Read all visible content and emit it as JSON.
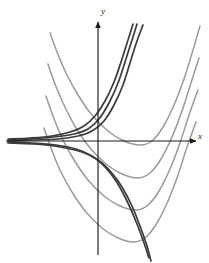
{
  "figure": {
    "type": "math-curve-family-diagram",
    "background_color": "#ffffff",
    "axes": {
      "x_label": "x",
      "y_label": "y",
      "axis_color": "#1b1b1b",
      "origin_px": [
        98,
        141
      ],
      "x_axis_y_px": 141,
      "y_axis_x_px": 98,
      "x_axis_from_px": [
        6,
        141
      ],
      "x_axis_to_px": [
        196,
        141
      ],
      "y_axis_from_px": [
        98,
        255
      ],
      "y_axis_to_px": [
        98,
        22
      ],
      "arrowheads": [
        "x-positive",
        "y-positive"
      ]
    },
    "chart_data": {
      "type": "line",
      "title": "",
      "xlabel": "x",
      "ylabel": "y",
      "grid": false,
      "legend": null,
      "xlim": [
        -3.5,
        3.5
      ],
      "ylim": [
        -4.0,
        4.5
      ],
      "annotations": [
        "Dark curves converge to a horizontal asymptote on the left, forming a thick band near y = 0 left of the y-axis.",
        "Gray curves are a nested family of upward-opening parabola-like curves whose vertices descend to the lower-left."
      ],
      "series": [
        {
          "name": "gray-parabola-1",
          "color": "#9a9a9a",
          "style": "solid",
          "role": "solution-curve",
          "points_px": [
            [
              50,
              33
            ],
            [
              57,
              52
            ],
            [
              66,
              73
            ],
            [
              78,
              95
            ],
            [
              92,
              115
            ],
            [
              108,
              131
            ],
            [
              124,
              141
            ],
            [
              140,
              145
            ],
            [
              152,
              141
            ],
            [
              163,
              127
            ],
            [
              174,
              105
            ],
            [
              184,
              79
            ],
            [
              193,
              50
            ],
            [
              200,
              26
            ]
          ]
        },
        {
          "name": "gray-parabola-2",
          "color": "#9a9a9a",
          "style": "solid",
          "role": "solution-curve",
          "points_px": [
            [
              48,
              64
            ],
            [
              55,
              84
            ],
            [
              64,
              105
            ],
            [
              76,
              128
            ],
            [
              90,
              148
            ],
            [
              106,
              164
            ],
            [
              122,
              174
            ],
            [
              138,
              178
            ],
            [
              150,
              173
            ],
            [
              161,
              159
            ],
            [
              172,
              137
            ],
            [
              182,
              111
            ],
            [
              191,
              83
            ],
            [
              199,
              58
            ]
          ]
        },
        {
          "name": "gray-parabola-3",
          "color": "#9a9a9a",
          "style": "solid",
          "role": "solution-curve",
          "points_px": [
            [
              46,
              96
            ],
            [
              53,
              116
            ],
            [
              62,
              138
            ],
            [
              74,
              160
            ],
            [
              88,
              180
            ],
            [
              104,
              196
            ],
            [
              120,
              206
            ],
            [
              136,
              210
            ],
            [
              148,
              205
            ],
            [
              159,
              191
            ],
            [
              170,
              169
            ],
            [
              180,
              143
            ],
            [
              189,
              115
            ],
            [
              198,
              90
            ]
          ]
        },
        {
          "name": "gray-parabola-4",
          "color": "#9a9a9a",
          "style": "solid",
          "role": "solution-curve",
          "points_px": [
            [
              44,
              128
            ],
            [
              51,
              148
            ],
            [
              60,
              170
            ],
            [
              72,
              192
            ],
            [
              86,
              212
            ],
            [
              102,
              228
            ],
            [
              118,
              238
            ],
            [
              134,
              242
            ],
            [
              146,
              237
            ],
            [
              157,
              223
            ],
            [
              168,
              201
            ],
            [
              178,
              175
            ],
            [
              187,
              147
            ],
            [
              196,
              122
            ]
          ]
        },
        {
          "name": "dark-exponential-1",
          "color": "#3b3b3b",
          "style": "solid",
          "role": "asymptotic-curve",
          "points_px": [
            [
              8,
              139
            ],
            [
              30,
              138
            ],
            [
              52,
              136
            ],
            [
              70,
              132
            ],
            [
              84,
              126
            ],
            [
              95,
              116
            ],
            [
              105,
              101
            ],
            [
              114,
              82
            ],
            [
              121,
              62
            ],
            [
              128,
              40
            ],
            [
              133,
              24
            ]
          ]
        },
        {
          "name": "dark-exponential-2",
          "color": "#3b3b3b",
          "style": "solid",
          "role": "asymptotic-curve",
          "points_px": [
            [
              8,
              140
            ],
            [
              30,
              139
            ],
            [
              54,
              137
            ],
            [
              74,
              134
            ],
            [
              88,
              129
            ],
            [
              99,
              119
            ],
            [
              109,
              103
            ],
            [
              118,
              83
            ],
            [
              125,
              62
            ],
            [
              132,
              40
            ],
            [
              137,
              24
            ]
          ]
        },
        {
          "name": "dark-exponential-3",
          "color": "#3b3b3b",
          "style": "solid",
          "role": "asymptotic-curve",
          "points_px": [
            [
              8,
              141
            ],
            [
              32,
              140
            ],
            [
              58,
              139
            ],
            [
              78,
              136
            ],
            [
              92,
              131
            ],
            [
              104,
              121
            ],
            [
              114,
              105
            ],
            [
              123,
              85
            ],
            [
              130,
              63
            ],
            [
              137,
              41
            ],
            [
              143,
              25
            ]
          ]
        },
        {
          "name": "dark-descending-1",
          "color": "#3b3b3b",
          "style": "solid",
          "role": "asymptotic-curve",
          "points_px": [
            [
              8,
              142
            ],
            [
              32,
              143
            ],
            [
              56,
              145
            ],
            [
              76,
              149
            ],
            [
              92,
              156
            ],
            [
              105,
              167
            ],
            [
              116,
              181
            ],
            [
              126,
              199
            ],
            [
              135,
              219
            ],
            [
              143,
              240
            ],
            [
              149,
              258
            ]
          ]
        },
        {
          "name": "dark-descending-2",
          "color": "#3b3b3b",
          "style": "solid",
          "role": "asymptotic-curve",
          "points_px": [
            [
              8,
              143
            ],
            [
              34,
              144
            ],
            [
              60,
              147
            ],
            [
              82,
              152
            ],
            [
              98,
              160
            ],
            [
              111,
              172
            ],
            [
              122,
              187
            ],
            [
              132,
              206
            ],
            [
              140,
              226
            ],
            [
              147,
              246
            ],
            [
              151,
              261
            ]
          ]
        }
      ]
    }
  }
}
